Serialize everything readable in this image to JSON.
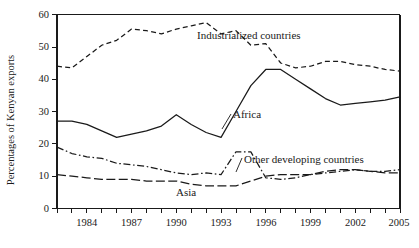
{
  "chart_data": {
    "type": "line",
    "title": "",
    "xlabel": "",
    "ylabel": "Percentages of Kenyan exports",
    "xlim": [
      1982,
      2005
    ],
    "ylim": [
      0,
      60
    ],
    "grid": false,
    "legend_position": "inline-annotations",
    "x": [
      1982,
      1983,
      1984,
      1985,
      1986,
      1987,
      1988,
      1989,
      1990,
      1991,
      1992,
      1993,
      1994,
      1995,
      1996,
      1997,
      1998,
      1999,
      2000,
      2001,
      2002,
      2003,
      2004,
      2005
    ],
    "xticks": [
      1982,
      1983,
      1984,
      1985,
      1986,
      1987,
      1988,
      1989,
      1990,
      1991,
      1992,
      1993,
      1994,
      1995,
      1996,
      1997,
      1998,
      1999,
      2000,
      2001,
      2002,
      2003,
      2004,
      2005
    ],
    "xtick_labels_shown": [
      "1984",
      "1987",
      "1990",
      "1993",
      "1996",
      "1999",
      "2002",
      "2005"
    ],
    "yticks": [
      0,
      10,
      20,
      30,
      40,
      50,
      60
    ],
    "ytick_labels": [
      "0",
      "10",
      "20",
      "30",
      "40",
      "50",
      "60"
    ],
    "series": [
      {
        "name": "Industrialized countries",
        "style": "dashed",
        "label_x": 2005,
        "values": [
          44.0,
          43.5,
          47.0,
          50.5,
          52.0,
          55.5,
          55.0,
          54.0,
          55.5,
          56.5,
          57.5,
          54.0,
          55.0,
          50.5,
          51.0,
          45.0,
          43.5,
          44.0,
          45.5,
          45.5,
          44.5,
          44.0,
          43.0,
          42.5
        ]
      },
      {
        "name": "Africa",
        "style": "solid",
        "values": [
          27.0,
          27.0,
          26.0,
          24.0,
          22.0,
          23.0,
          24.0,
          25.5,
          29.0,
          26.0,
          23.5,
          22.0,
          30.0,
          38.0,
          43.0,
          43.0,
          40.0,
          37.0,
          34.0,
          32.0,
          32.5,
          33.0,
          33.5,
          34.5
        ]
      },
      {
        "name": "Other developing countries",
        "style": "dashdot",
        "values": [
          19.0,
          17.0,
          16.0,
          15.5,
          14.0,
          13.5,
          13.0,
          12.0,
          11.0,
          10.5,
          11.0,
          10.5,
          17.5,
          17.5,
          9.5,
          9.0,
          9.5,
          10.5,
          11.0,
          11.5,
          12.0,
          11.5,
          11.5,
          12.0
        ]
      },
      {
        "name": "Asia",
        "style": "longdash",
        "values": [
          10.5,
          10.0,
          9.5,
          9.0,
          9.0,
          9.0,
          8.5,
          8.5,
          8.5,
          7.5,
          7.0,
          7.0,
          7.0,
          8.5,
          10.0,
          10.5,
          10.5,
          10.5,
          11.5,
          12.0,
          12.0,
          11.5,
          11.0,
          11.0
        ]
      }
    ],
    "annotations": [
      {
        "text": "Industrialized countries",
        "anchor_year": 1995,
        "anchor_value": 55
      },
      {
        "text": "Africa",
        "anchor_year": 1994,
        "anchor_value": 31
      },
      {
        "text": "Other developing countries",
        "anchor_year": 1995,
        "anchor_value": 17
      },
      {
        "text": "Asia",
        "anchor_year": 1994,
        "anchor_value": 7
      }
    ]
  },
  "labels": {
    "y_axis_title": "Percentages of Kenyan exports",
    "industrialized": "Industrialized countries",
    "africa": "Africa",
    "other_developing": "Other developing countries",
    "asia": "Asia",
    "y0": "0",
    "y10": "10",
    "y20": "20",
    "y30": "30",
    "y40": "40",
    "y50": "50",
    "y60": "60",
    "x1984": "1984",
    "x1987": "1987",
    "x1990": "1990",
    "x1993": "1993",
    "x1996": "1996",
    "x1999": "1999",
    "x2002": "2002",
    "x2005": "2005"
  },
  "colors": {
    "ink": "#1a1a1a",
    "background": "#ffffff"
  }
}
